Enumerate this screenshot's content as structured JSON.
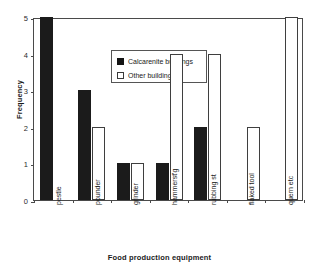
{
  "chart_data": {
    "type": "bar",
    "title": "",
    "xlabel": "Food production equipment",
    "ylabel": "Frequency",
    "ylim": [
      0,
      5
    ],
    "yticks": [
      0,
      1,
      2,
      3,
      4,
      5
    ],
    "grid": false,
    "legend_position": "top-left-inside",
    "categories": [
      "pestle",
      "pounder",
      "grinder",
      "hammerst'g",
      "rubbing st",
      "flaked tool",
      "quern etc"
    ],
    "series": [
      {
        "name": "Calcarenite buildings",
        "color": "#141414",
        "values": [
          5,
          3,
          1,
          1,
          2,
          0,
          0
        ]
      },
      {
        "name": "Other buildings",
        "color": "#ffffff",
        "values": [
          0,
          2,
          1,
          4,
          4,
          2,
          5
        ]
      }
    ]
  },
  "legend": {
    "items": [
      {
        "label": "Calcarenite buildings",
        "swatch": "filled"
      },
      {
        "label": "Other buildings",
        "swatch": "hollow"
      }
    ]
  },
  "axes": {
    "y_title": "Frequency",
    "x_title": "Food production equipment",
    "y_tick_labels": [
      "5",
      "4",
      "3",
      "2",
      "1",
      "0"
    ],
    "x_tick_labels": [
      "pestle",
      "pounder",
      "grinder",
      "hammerst'g",
      "rubbing st",
      "flaked tool",
      "quern etc"
    ]
  }
}
